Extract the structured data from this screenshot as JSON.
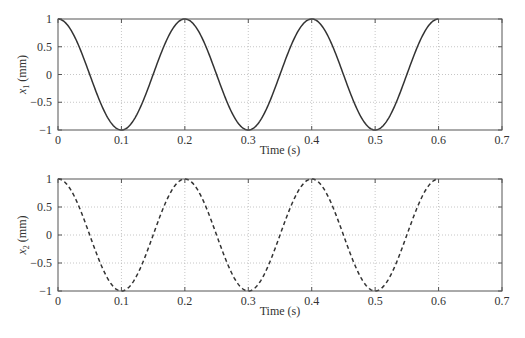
{
  "chart_data": [
    {
      "type": "line",
      "title": "",
      "xlabel": "Time (s)",
      "ylabel": "x_1 (mm)",
      "ylabel_symbol": "x",
      "ylabel_sub": "1",
      "ylabel_unit": "(mm)",
      "xlim": [
        0,
        0.7
      ],
      "ylim": [
        -1,
        1
      ],
      "xticks": [
        "0",
        "0.1",
        "0.2",
        "0.3",
        "0.4",
        "0.5",
        "0.6",
        "0.7"
      ],
      "yticks": [
        "1",
        "0.5",
        "0",
        "−0.5",
        "−1"
      ],
      "grid": true,
      "series": [
        {
          "name": "x1",
          "style": "solid",
          "color": "#333333",
          "function": "cos(2*pi*5*t)",
          "t_range": [
            0,
            0.6
          ],
          "x": [
            0,
            0.05,
            0.1,
            0.15,
            0.2,
            0.25,
            0.3,
            0.35,
            0.4,
            0.45,
            0.5,
            0.55,
            0.6
          ],
          "values": [
            1,
            0,
            -1,
            0,
            1,
            0,
            -1,
            0,
            1,
            0,
            -1,
            0,
            1
          ]
        }
      ]
    },
    {
      "type": "line",
      "title": "",
      "xlabel": "Time (s)",
      "ylabel": "x_2 (mm)",
      "ylabel_symbol": "x",
      "ylabel_sub": "2",
      "ylabel_unit": "(mm)",
      "xlim": [
        0,
        0.7
      ],
      "ylim": [
        -1,
        1
      ],
      "xticks": [
        "0",
        "0.1",
        "0.2",
        "0.3",
        "0.4",
        "0.5",
        "0.6",
        "0.7"
      ],
      "yticks": [
        "1",
        "0.5",
        "0",
        "−0.5",
        "−1"
      ],
      "grid": true,
      "series": [
        {
          "name": "x2",
          "style": "dashed",
          "color": "#333333",
          "function": "cos(2*pi*5*t)",
          "t_range": [
            0,
            0.6
          ],
          "x": [
            0,
            0.05,
            0.1,
            0.15,
            0.2,
            0.25,
            0.3,
            0.35,
            0.4,
            0.45,
            0.5,
            0.55,
            0.6
          ],
          "values": [
            1,
            0,
            -1,
            0,
            1,
            0,
            -1,
            0,
            1,
            0,
            -1,
            0,
            1
          ]
        }
      ]
    }
  ]
}
